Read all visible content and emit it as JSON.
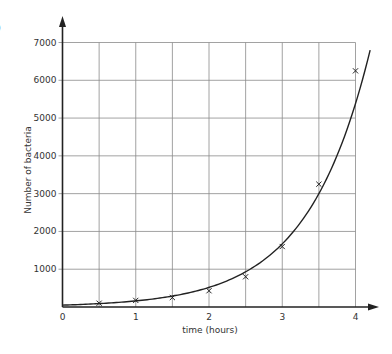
{
  "part_label": ")",
  "chart_data": {
    "type": "line",
    "title": "",
    "xlabel": "time (hours)",
    "ylabel": "Number of bacteria",
    "x_ticks": [
      "0",
      "1",
      "2",
      "3",
      "4"
    ],
    "y_ticks": [
      "1000",
      "2000",
      "3000",
      "4000",
      "5000",
      "6000",
      "7000"
    ],
    "xlim": [
      0,
      4
    ],
    "ylim": [
      0,
      7000
    ],
    "grid": true,
    "x_grid_step": 0.5,
    "y_grid_step": 1000,
    "legend": null,
    "series": [
      {
        "name": "Number of bacteria",
        "marker": "x",
        "x": [
          0.5,
          1,
          1.5,
          2,
          2.5,
          3,
          3.5,
          4
        ],
        "values": [
          100,
          175,
          250,
          430,
          800,
          1600,
          3250,
          6250
        ]
      }
    ],
    "curve_fit": {
      "type": "exponential",
      "start": [
        0,
        50
      ],
      "end": [
        4.2,
        6800
      ]
    }
  }
}
